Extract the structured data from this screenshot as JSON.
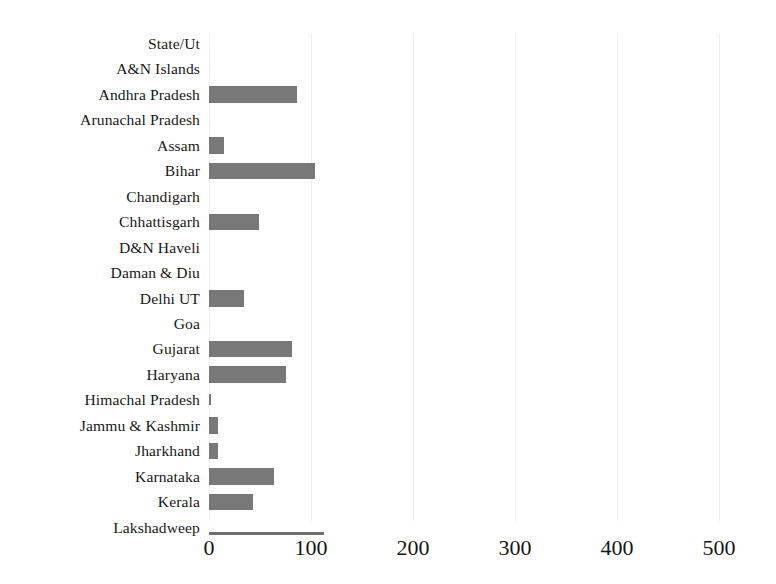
{
  "chart_data": {
    "type": "bar",
    "orientation": "horizontal",
    "title": "",
    "xlabel": "",
    "ylabel": "",
    "xlim": [
      0,
      540
    ],
    "ylim": null,
    "grid": "faint vertical gridlines at x ticks",
    "legend": "none",
    "bar_color": "#787878",
    "background_color": "#ffffff",
    "header_row_label": "State/Ut",
    "xticks": [
      0,
      100,
      200,
      300,
      400,
      500
    ],
    "xtick_labels": [
      "0",
      "100",
      "200",
      "300",
      "400",
      "500"
    ],
    "categories": [
      "State/Ut",
      "A&N Islands",
      "Andhra Pradesh",
      "Arunachal Pradesh",
      "Assam",
      "Bihar",
      "Chandigarh",
      "Chhattisgarh",
      "D&N Haveli",
      "Daman & Diu",
      "Delhi UT",
      "Goa",
      "Gujarat",
      "Haryana",
      "Himachal Pradesh",
      "Jammu & Kashmir",
      "Jharkhand",
      "Karnataka",
      "Kerala",
      "Lakshadweep"
    ],
    "values": [
      0,
      0,
      86,
      0,
      15,
      104,
      0,
      49,
      0,
      0,
      34,
      0,
      81,
      75,
      2,
      9,
      9,
      64,
      43,
      0
    ],
    "series": [
      {
        "name": "count",
        "values": [
          0,
          0,
          86,
          0,
          15,
          104,
          0,
          49,
          0,
          0,
          34,
          0,
          81,
          75,
          2,
          9,
          9,
          64,
          43,
          0
        ]
      }
    ]
  }
}
